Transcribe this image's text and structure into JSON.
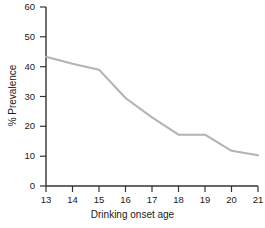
{
  "chart_data": {
    "type": "line",
    "title": "",
    "subtitle": "",
    "xlabel": "Drinking onset age",
    "ylabel": "% Prevalence",
    "x": [
      13,
      14,
      15,
      16,
      17,
      18,
      19,
      20,
      21
    ],
    "values": [
      43.3,
      41.0,
      39.0,
      29.5,
      23.0,
      17.2,
      17.2,
      11.8,
      10.3
    ],
    "series": [
      {
        "name": "Prevalence",
        "values": [
          43.3,
          41.0,
          39.0,
          29.5,
          23.0,
          17.2,
          17.2,
          11.8,
          10.3
        ]
      }
    ],
    "xlim": [
      13,
      21
    ],
    "ylim": [
      0,
      60
    ],
    "x_ticks": [
      "13",
      "14",
      "15",
      "16",
      "17",
      "18",
      "19",
      "20",
      "21"
    ],
    "y_ticks": [
      "0",
      "10",
      "20",
      "30",
      "40",
      "50",
      "60"
    ],
    "grid": false,
    "legend": "none",
    "annotations": []
  },
  "style": {
    "line_color": "#b3b3b3",
    "axis_color": "#333333",
    "text_color": "#1a1a1a",
    "background": "#ffffff"
  }
}
